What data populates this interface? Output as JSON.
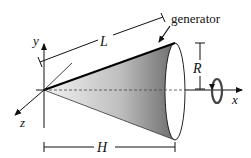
{
  "diagram": {
    "labels": {
      "generator": "generator",
      "slant_length": "L",
      "radius": "R",
      "height": "H",
      "x_axis": "x",
      "y_axis": "y",
      "z_axis": "z"
    },
    "icons": {
      "rotation": "rotation-arrow-icon"
    },
    "colors": {
      "stroke": "#111111",
      "cone_fill_light": "#f2f2f2",
      "cone_fill_dark": "#6a6a6a"
    }
  }
}
